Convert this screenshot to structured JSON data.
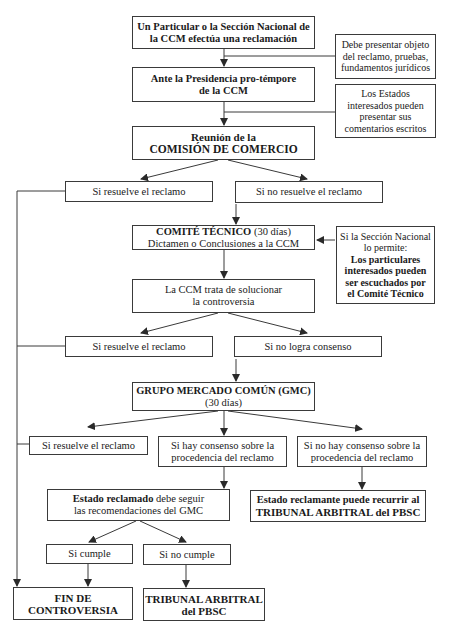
{
  "diagram": {
    "type": "flowchart",
    "nodes": {
      "start": {
        "line1": "Un Particular o la Sección Nacional de",
        "line2": "la CCM efectúa una reclamación"
      },
      "note_requisitos": {
        "line1": "Debe presentar objeto",
        "line2": "del reclamo, pruebas,",
        "line3": "fundamentos jurídicos"
      },
      "presidencia": {
        "line1": "Ante la Presidencia pro-témpore",
        "line2": "de la CCM"
      },
      "note_estados": {
        "line1": "Los Estados",
        "line2": "interesados pueden",
        "line3": "presentar  sus",
        "line4": "comentarios escritos"
      },
      "reunion": {
        "line1": "Reunión de la",
        "line2": "COMISIÓN DE COMERCIO"
      },
      "resuelve_1": {
        "label": "Si resuelve el reclamo"
      },
      "no_resuelve_1": {
        "label": "Si no resuelve el reclamo"
      },
      "comite": {
        "title": "COMITÉ TÉCNICO",
        "days": "(30 días)",
        "line2": "Dictamen o Conclusiones a la CCM"
      },
      "note_particulares": {
        "line1": "Si la Sección Nacional",
        "line2": "lo permite:",
        "line3": "Los particulares",
        "line4": "interesados pueden",
        "line5": "ser escuchados por",
        "line6": "el Comité Técnico"
      },
      "ccm_trata": {
        "line1": "La CCM trata de solucionar",
        "line2": "la controversia"
      },
      "resuelve_2": {
        "label": "Si resuelve el reclamo"
      },
      "no_consenso": {
        "label": "Si no logra consenso"
      },
      "gmc": {
        "line1": "GRUPO MERCADO COMÚN (GMC)",
        "line2": "(30 días)"
      },
      "resuelve_3": {
        "label": "Si resuelve el reclamo"
      },
      "hay_consenso": {
        "line1": "Si hay consenso sobre la",
        "line2": "procedencia del reclamo"
      },
      "no_hay_consenso": {
        "line1": "Si no hay consenso sobre la",
        "line2": "procedencia del reclamo"
      },
      "estado_reclamado": {
        "bold": "Estado reclamado",
        "rest": " debe seguir",
        "line2": "las recomendaciones del GMC"
      },
      "estado_reclamante": {
        "line1": "Estado reclamante puede recurrir al",
        "line2": "TRIBUNAL ARBITRAL del PBSC"
      },
      "cumple": {
        "label": "Si cumple"
      },
      "no_cumple": {
        "label": "Si no cumple"
      },
      "fin": {
        "line1": "FIN DE",
        "line2": "CONTROVERSIA"
      },
      "tribunal": {
        "line1": "TRIBUNAL ARBITRAL",
        "line2": "del PBSC"
      }
    },
    "colors": {
      "stroke": "#3a3a3a",
      "background": "#ffffff",
      "text": "#1a1a1a"
    }
  }
}
